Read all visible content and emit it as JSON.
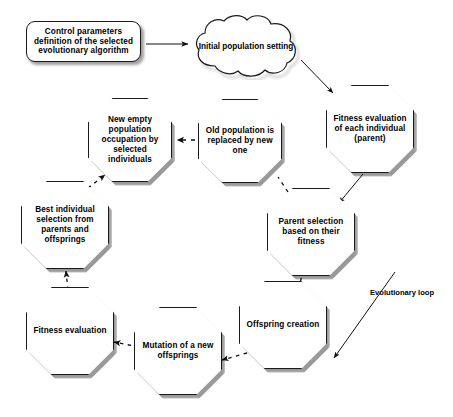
{
  "diagram": {
    "background_color": "#ffffff",
    "stroke_color": "#1a1a1a",
    "text_color": "#000000",
    "annotation": {
      "loop_label": "Evolutionary loop"
    },
    "nodes": [
      {
        "id": "control-parameters",
        "shape": "rounded-rectangle",
        "label": "Control parameters definition of the selected evolutionary algorithm"
      },
      {
        "id": "initial-population",
        "shape": "cloud",
        "label": "Initial population setting"
      },
      {
        "id": "fitness-evaluation-parent",
        "shape": "octagon",
        "label": "Fitness evaluation of each individual (parent)"
      },
      {
        "id": "parent-selection",
        "shape": "octagon",
        "label": "Parent selection based on their fitness"
      },
      {
        "id": "offspring-creation",
        "shape": "octagon",
        "label": "Offspring creation"
      },
      {
        "id": "mutation",
        "shape": "octagon",
        "label": "Mutation of a new offsprings"
      },
      {
        "id": "fitness-evaluation",
        "shape": "octagon",
        "label": "Fitness evaluation"
      },
      {
        "id": "best-individual-selection",
        "shape": "octagon",
        "label": "Best individual selection from parents and offsprings"
      },
      {
        "id": "new-empty-population",
        "shape": "octagon",
        "label": "New empty population occupation by selected individuals"
      },
      {
        "id": "old-population-replaced",
        "shape": "octagon",
        "label": "Old population is replaced by new one"
      }
    ],
    "edges": [
      {
        "id": "control-to-initial",
        "from": "control-parameters",
        "to": "initial-population",
        "style": "solid"
      },
      {
        "id": "initial-to-fitness-parent",
        "from": "initial-population",
        "to": "fitness-evaluation-parent",
        "style": "solid"
      },
      {
        "id": "fitness-parent-to-parent-selection",
        "from": "fitness-evaluation-parent",
        "to": "parent-selection",
        "style": "solid"
      },
      {
        "id": "parent-selection-to-offspring",
        "from": "parent-selection",
        "to": "offspring-creation",
        "style": "dashed"
      },
      {
        "id": "offspring-to-mutation",
        "from": "offspring-creation",
        "to": "mutation",
        "style": "dashed"
      },
      {
        "id": "mutation-to-fitness",
        "from": "mutation",
        "to": "fitness-evaluation",
        "style": "dashed"
      },
      {
        "id": "fitness-to-best-individual",
        "from": "fitness-evaluation",
        "to": "best-individual-selection",
        "style": "dashed"
      },
      {
        "id": "best-individual-to-new-empty",
        "from": "best-individual-selection",
        "to": "new-empty-population",
        "style": "dashed"
      },
      {
        "id": "old-population-to-new-empty",
        "from": "old-population-replaced",
        "to": "new-empty-population",
        "style": "dashed"
      },
      {
        "id": "evolutionary-loop-arrow",
        "from": "parent-selection",
        "to": "offspring-creation",
        "style": "solid"
      }
    ]
  }
}
